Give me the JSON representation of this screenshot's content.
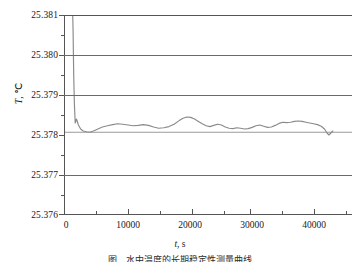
{
  "axes": {
    "y_title_symbol": "T",
    "y_title_sep": ", ",
    "y_title_unit": "℃",
    "x_title_symbol": "t",
    "x_title_sep": ", ",
    "x_title_unit": "s",
    "y_ticks": [
      "25.381",
      "25.380",
      "25.379",
      "25.378",
      "25.377",
      "25.376"
    ],
    "x_ticks": [
      "0",
      "10000",
      "20000",
      "30000",
      "40000"
    ]
  },
  "caption": {
    "text": "图     水中温度的长期稳定性测量曲线"
  },
  "colors": {
    "curve": "#8a8a8a",
    "reference_line": "#9a9a9a",
    "grid": "#6a6a6a",
    "axis": "#555555",
    "text": "#1a1a1a",
    "background": "#ffffff"
  },
  "chart_data": {
    "type": "line",
    "title": "",
    "subtitle": "",
    "xlabel": "t, s",
    "ylabel": "T, ℃",
    "xlim": [
      0,
      45000
    ],
    "ylim": [
      25.376,
      25.381
    ],
    "grid": true,
    "gridlines_y": [
      25.377,
      25.379,
      25.38
    ],
    "legend": "none",
    "y_tick_values": [
      25.381,
      25.38,
      25.379,
      25.378,
      25.377,
      25.376
    ],
    "x_tick_values": [
      0,
      10000,
      20000,
      30000,
      40000
    ],
    "y_minor_step": 0.0005,
    "x_minor_step": 5000,
    "annotations": [
      {
        "kind": "reference-line",
        "orientation": "horizontal",
        "value": 25.37807,
        "label": ""
      }
    ],
    "series": [
      {
        "name": "Water bath temperature",
        "x": [
          1350,
          1380,
          1420,
          1470,
          1530,
          1620,
          1750,
          1950,
          2250,
          2600,
          3000,
          3500,
          4000,
          4600,
          5300,
          6000,
          6800,
          7600,
          8400,
          9200,
          10000,
          10800,
          11600,
          12400,
          13200,
          14000,
          14800,
          15600,
          16400,
          17200,
          18000,
          18600,
          19200,
          19800,
          20400,
          21000,
          21600,
          22200,
          22800,
          23400,
          24000,
          24600,
          25200,
          25800,
          26400,
          27000,
          27600,
          28200,
          28800,
          29400,
          30000,
          30600,
          31200,
          31800,
          32400,
          33000,
          33600,
          34200,
          34800,
          35400,
          36000,
          36600,
          37200,
          37800,
          38400,
          39000,
          39600,
          40200,
          40700,
          41100,
          41400,
          41700,
          42000
        ],
        "y": [
          25.381,
          25.3809,
          25.3806,
          25.38,
          25.3794,
          25.3788,
          25.3783,
          25.3784,
          25.37825,
          25.37815,
          25.3781,
          25.37808,
          25.37807,
          25.3781,
          25.37815,
          25.3782,
          25.37823,
          25.37826,
          25.37828,
          25.37827,
          25.37825,
          25.37823,
          25.37824,
          25.37826,
          25.37824,
          25.3782,
          25.37817,
          25.37818,
          25.37821,
          25.37827,
          25.37836,
          25.37842,
          25.37845,
          25.37844,
          25.3784,
          25.37834,
          25.37828,
          25.37823,
          25.37821,
          25.37824,
          25.37827,
          25.37825,
          25.3782,
          25.37817,
          25.37816,
          25.37818,
          25.37817,
          25.37815,
          25.37816,
          25.37819,
          25.37823,
          25.37825,
          25.37822,
          25.37819,
          25.3782,
          25.37824,
          25.37829,
          25.37832,
          25.37831,
          25.37832,
          25.37834,
          25.37835,
          25.37834,
          25.37832,
          25.3783,
          25.37828,
          25.37826,
          25.37822,
          25.37815,
          25.37805,
          25.378,
          25.37805,
          25.3781
        ]
      }
    ]
  }
}
